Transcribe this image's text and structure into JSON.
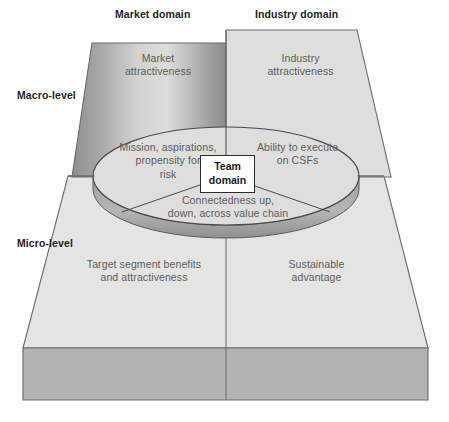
{
  "diagram": {
    "title_labels": {
      "market_domain": "Market domain",
      "industry_domain": "Industry domain",
      "macro_level": "Macro-level",
      "micro_level": "Micro-level"
    },
    "panels": [
      {
        "id": "market-attractiveness",
        "level": "macro",
        "domain": "market",
        "line1": "Market",
        "line2": "attractiveness"
      },
      {
        "id": "industry-attractiveness",
        "level": "macro",
        "domain": "industry",
        "line1": "Industry",
        "line2": "attractiveness"
      },
      {
        "id": "target-segment-benefits",
        "level": "micro",
        "domain": "market",
        "line1": "Target segment benefits",
        "line2": "and attractiveness"
      },
      {
        "id": "sustainable-advantage",
        "level": "micro",
        "domain": "industry",
        "line1": "Sustainable",
        "line2": "advantage"
      }
    ],
    "team_domain": {
      "line1": "Team",
      "line2": "domain"
    },
    "team_segments": [
      {
        "id": "mission-aspirations",
        "line1": "Mission, aspirations,",
        "line2": "propensity for",
        "line3": "risk"
      },
      {
        "id": "ability-to-execute",
        "line1": "Ability to execute",
        "line2": "on CSFs"
      },
      {
        "id": "connectedness",
        "line1": "Connectedness up,",
        "line2": "down, across value chain"
      }
    ],
    "colors": {
      "panel_fill": "#e2e2e0",
      "base_fill": "#b5b5b5",
      "gradient_dark": "#8f8f8f",
      "gradient_light": "#d8d8d6",
      "outline": "#555555",
      "text_dark": "#231f20",
      "text_gray": "#5c5c5c",
      "ellipse_fill": "#dcdcda",
      "ellipse_band": "#a9a9a7"
    }
  }
}
